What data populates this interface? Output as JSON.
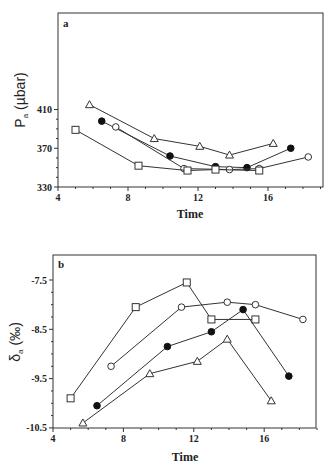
{
  "chart_data": [
    {
      "type": "line",
      "panel_label": "a",
      "title": "",
      "xlabel": "Time",
      "ylabel": "Pₐ (µbar)",
      "xlim": [
        4,
        19
      ],
      "ylim": [
        330,
        418
      ],
      "xticks": [
        4,
        8,
        12,
        16
      ],
      "yticks": [
        330,
        370,
        410
      ],
      "grid": false,
      "legend": "none",
      "series": [
        {
          "name": "open-triangle",
          "marker": "triangle-open",
          "x": [
            5.8,
            9.5,
            12.1,
            13.8,
            16.3
          ],
          "y": [
            415,
            380,
            372,
            363,
            375
          ]
        },
        {
          "name": "filled-circle",
          "marker": "circle-filled",
          "x": [
            6.5,
            10.4,
            13.0,
            14.8,
            17.3
          ],
          "y": [
            398,
            362,
            351,
            350,
            370
          ]
        },
        {
          "name": "open-circle",
          "marker": "circle-open",
          "x": [
            7.3,
            11.2,
            13.8,
            15.5,
            18.3
          ],
          "y": [
            392,
            349,
            348,
            349,
            361
          ]
        },
        {
          "name": "open-square",
          "marker": "square-open",
          "x": [
            5.0,
            8.6,
            11.4,
            13.0,
            15.5
          ],
          "y": [
            389,
            352,
            347,
            348,
            347
          ]
        }
      ]
    },
    {
      "type": "line",
      "panel_label": "b",
      "title": "",
      "xlabel": "Time",
      "ylabel": "δₐ (‰)",
      "xlim": [
        4,
        19
      ],
      "ylim": [
        -10.5,
        -7.0
      ],
      "xticks": [
        4,
        8,
        12,
        16
      ],
      "yticks": [
        -7.5,
        -8.5,
        -9.5,
        -10.5
      ],
      "grid": false,
      "legend": "none",
      "series": [
        {
          "name": "open-square",
          "marker": "square-open",
          "x": [
            5.0,
            8.7,
            11.6,
            13.0,
            15.5
          ],
          "y": [
            -9.9,
            -8.05,
            -7.55,
            -8.3,
            -8.3
          ]
        },
        {
          "name": "open-circle",
          "marker": "circle-open",
          "x": [
            7.3,
            11.3,
            13.9,
            15.5,
            18.2
          ],
          "y": [
            -9.25,
            -8.05,
            -7.95,
            -8.0,
            -8.3
          ]
        },
        {
          "name": "filled-circle",
          "marker": "circle-filled",
          "x": [
            6.5,
            10.5,
            13.0,
            14.8,
            17.4
          ],
          "y": [
            -10.05,
            -8.85,
            -8.55,
            -8.1,
            -9.45
          ]
        },
        {
          "name": "open-triangle",
          "marker": "triangle-open",
          "x": [
            5.7,
            9.5,
            12.2,
            13.9,
            16.4
          ],
          "y": [
            -10.4,
            -9.4,
            -9.15,
            -8.7,
            -9.95
          ]
        }
      ]
    }
  ],
  "labels": {
    "panel_a": "a",
    "panel_b": "b",
    "xlabel": "Time",
    "ylabel_a_main": "P",
    "ylabel_a_sub": "a",
    "ylabel_a_unit": "(µbar)",
    "ylabel_b_main": "δ",
    "ylabel_b_sub": "a",
    "ylabel_b_unit": "(‰)"
  },
  "style": {
    "line_color": "#333333",
    "marker_fill": "#ffffff",
    "filled_marker": "#111111",
    "axis_color": "#333333"
  }
}
